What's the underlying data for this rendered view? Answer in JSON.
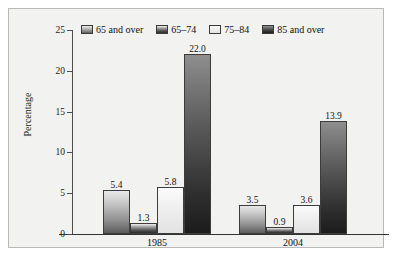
{
  "chart_data": {
    "type": "bar",
    "title": "",
    "xlabel": "",
    "ylabel": "Percentage",
    "categories": [
      "1985",
      "2004"
    ],
    "series": [
      {
        "name": "65 and over",
        "values": [
          5.4,
          3.5
        ],
        "labels": [
          "5.4",
          "3.5"
        ],
        "swatch": "gradient-medium"
      },
      {
        "name": "65–74",
        "values": [
          1.3,
          0.9
        ],
        "labels": [
          "1.3",
          "0.9"
        ],
        "swatch": "gradient-dark"
      },
      {
        "name": "75–84",
        "values": [
          5.8,
          3.6
        ],
        "labels": [
          "5.8",
          "3.6"
        ],
        "swatch": "light"
      },
      {
        "name": "85 and over",
        "values": [
          22.0,
          13.9
        ],
        "labels": [
          "22.0",
          "13.9"
        ],
        "swatch": "gradient-darkest"
      }
    ],
    "ylim": [
      0,
      25
    ],
    "yticks": [
      0,
      5,
      10,
      15,
      20,
      25
    ],
    "ytick_labels": [
      "0",
      "5",
      "10",
      "15",
      "20",
      "25"
    ],
    "grid": false,
    "legend_position": "top"
  },
  "legend": {
    "items": [
      {
        "label": "65 and over"
      },
      {
        "label": "65–74"
      },
      {
        "label": "75–84"
      },
      {
        "label": "85 and over"
      }
    ]
  },
  "axes": {
    "y_label": "Percentage",
    "y_ticks": [
      "25",
      "20",
      "15",
      "10",
      "5",
      "0"
    ],
    "x_labels": [
      "1985",
      "2004"
    ]
  },
  "colors": {
    "plot_background": "#f2f2f0",
    "frame_border": "#b9b9b9",
    "axis": "#333333",
    "text": "#111111"
  }
}
